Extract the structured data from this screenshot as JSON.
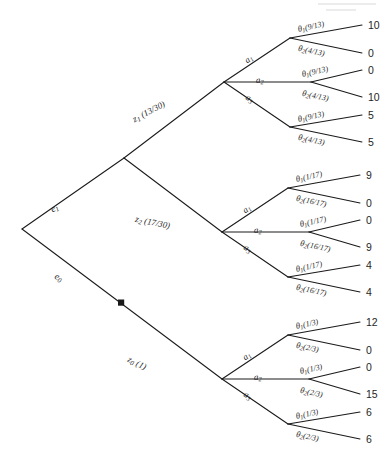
{
  "figure": {
    "type": "decision-tree",
    "root_label": "",
    "experiments": [
      {
        "id": "e1",
        "label_base": "e",
        "label_sub": "1"
      },
      {
        "id": "e0",
        "label_base": "e",
        "label_sub": "0"
      }
    ],
    "messages": [
      {
        "id": "z1",
        "base": "z",
        "sub": "1",
        "prob": "(13/30)"
      },
      {
        "id": "z2",
        "base": "z",
        "sub": "2",
        "prob": "(17/30)"
      },
      {
        "id": "z0",
        "base": "z",
        "sub": "0",
        "prob": "(1)"
      }
    ],
    "actions": [
      {
        "base": "a",
        "sub": "1"
      },
      {
        "base": "a",
        "sub": "2"
      },
      {
        "base": "a",
        "sub": "3"
      }
    ],
    "branches": [
      {
        "message": "z1",
        "message_text": "z",
        "message_sub": "1",
        "message_prob": "(13/30)",
        "experiment": "e1",
        "actions": [
          {
            "action_base": "a",
            "action_sub": "1",
            "states": [
              {
                "base": "θ",
                "sub": "1",
                "prob": "(9/13)",
                "payoff": "10"
              },
              {
                "base": "θ",
                "sub": "2",
                "prob": "(4/13)",
                "payoff": "0"
              }
            ]
          },
          {
            "action_base": "a",
            "action_sub": "2",
            "states": [
              {
                "base": "θ",
                "sub": "1",
                "prob": "(9/13)",
                "payoff": "0"
              },
              {
                "base": "θ",
                "sub": "2",
                "prob": "(4/13)",
                "payoff": "10"
              }
            ]
          },
          {
            "action_base": "a",
            "action_sub": "3",
            "states": [
              {
                "base": "θ",
                "sub": "1",
                "prob": "(9/13)",
                "payoff": "5"
              },
              {
                "base": "θ",
                "sub": "2",
                "prob": "(4/13)",
                "payoff": "5"
              }
            ]
          }
        ]
      },
      {
        "message": "z2",
        "message_text": "z",
        "message_sub": "2",
        "message_prob": "(17/30)",
        "experiment": "e1",
        "actions": [
          {
            "action_base": "a",
            "action_sub": "1",
            "states": [
              {
                "base": "θ",
                "sub": "1",
                "prob": "(1/17)",
                "payoff": "9"
              },
              {
                "base": "θ",
                "sub": "2",
                "prob": "(16/17)",
                "payoff": "0"
              }
            ]
          },
          {
            "action_base": "a",
            "action_sub": "2",
            "states": [
              {
                "base": "θ",
                "sub": "1",
                "prob": "(1/17)",
                "payoff": "0"
              },
              {
                "base": "θ",
                "sub": "2",
                "prob": "(16/17)",
                "payoff": "9"
              }
            ]
          },
          {
            "action_base": "a",
            "action_sub": "3",
            "states": [
              {
                "base": "θ",
                "sub": "1",
                "prob": "(1/17)",
                "payoff": "4"
              },
              {
                "base": "θ",
                "sub": "2",
                "prob": "(16/17)",
                "payoff": "4"
              }
            ]
          }
        ]
      },
      {
        "message": "z0",
        "message_text": "z",
        "message_sub": "0",
        "message_prob": "(1)",
        "experiment": "e0",
        "actions": [
          {
            "action_base": "a",
            "action_sub": "1",
            "states": [
              {
                "base": "θ",
                "sub": "1",
                "prob": "(1/3)",
                "payoff": "12"
              },
              {
                "base": "θ",
                "sub": "2",
                "prob": "(2/3)",
                "payoff": "0"
              }
            ]
          },
          {
            "action_base": "a",
            "action_sub": "2",
            "states": [
              {
                "base": "θ",
                "sub": "1",
                "prob": "(1/3)",
                "payoff": "0"
              },
              {
                "base": "θ",
                "sub": "2",
                "prob": "(2/3)",
                "payoff": "15"
              }
            ]
          },
          {
            "action_base": "a",
            "action_sub": "3",
            "states": [
              {
                "base": "θ",
                "sub": "1",
                "prob": "(1/3)",
                "payoff": "6"
              },
              {
                "base": "θ",
                "sub": "2",
                "prob": "(2/3)",
                "payoff": "6"
              }
            ]
          }
        ]
      }
    ],
    "marker": {
      "name": "optimal-branch-marker",
      "on_branch": "e0",
      "shape": "filled-square"
    },
    "colors": {
      "line": "#1a1a1a",
      "text": "#1f1f1f",
      "background": "#ffffff"
    }
  }
}
